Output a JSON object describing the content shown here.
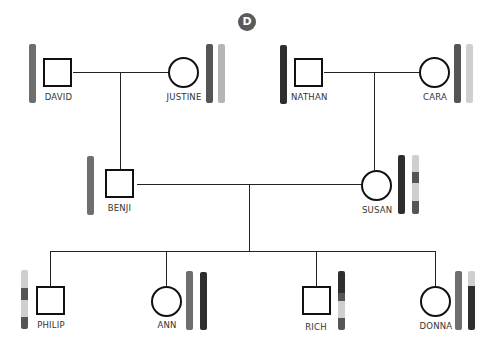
{
  "panel": {
    "label": "D",
    "badge_color": "#5a5a5a"
  },
  "colors": {
    "very_dark": "#2e2e2e",
    "dark": "#555555",
    "medium": "#6e6e6e",
    "light": "#bdbdbd",
    "lighter": "#cfcfcf",
    "line": "#222222"
  },
  "people": [
    {
      "id": "david",
      "name": "DAVID",
      "sex": "male",
      "generation": 1,
      "chromosomes": [
        [
          {
            "color": "#6e6e6e",
            "frac": 1
          }
        ]
      ]
    },
    {
      "id": "justine",
      "name": "JUSTINE",
      "sex": "female",
      "generation": 1,
      "chromosomes": [
        [
          {
            "color": "#555555",
            "frac": 1
          }
        ],
        [
          {
            "color": "#b5b5b5",
            "frac": 1
          }
        ]
      ]
    },
    {
      "id": "nathan",
      "name": "NATHAN",
      "sex": "male",
      "generation": 1,
      "chromosomes": [
        [
          {
            "color": "#2e2e2e",
            "frac": 1
          }
        ]
      ]
    },
    {
      "id": "cara",
      "name": "CARA",
      "sex": "female",
      "generation": 1,
      "chromosomes": [
        [
          {
            "color": "#555555",
            "frac": 1
          }
        ],
        [
          {
            "color": "#cfcfcf",
            "frac": 1
          }
        ]
      ]
    },
    {
      "id": "benji",
      "name": "BENJI",
      "sex": "male",
      "generation": 2,
      "chromosomes": [
        [
          {
            "color": "#6e6e6e",
            "frac": 1
          }
        ]
      ]
    },
    {
      "id": "susan",
      "name": "SUSAN",
      "sex": "female",
      "generation": 2,
      "chromosomes": [
        [
          {
            "color": "#2e2e2e",
            "frac": 1
          }
        ],
        [
          {
            "color": "#cfcfcf",
            "frac": 0.28
          },
          {
            "color": "#555555",
            "frac": 0.2
          },
          {
            "color": "#cfcfcf",
            "frac": 0.3
          },
          {
            "color": "#555555",
            "frac": 0.22
          }
        ]
      ]
    },
    {
      "id": "philip",
      "name": "PHILIP",
      "sex": "male",
      "generation": 3,
      "chromosomes": [
        [
          {
            "color": "#cfcfcf",
            "frac": 0.3
          },
          {
            "color": "#555555",
            "frac": 0.2
          },
          {
            "color": "#cfcfcf",
            "frac": 0.3
          },
          {
            "color": "#555555",
            "frac": 0.2
          }
        ]
      ]
    },
    {
      "id": "ann",
      "name": "ANN",
      "sex": "female",
      "generation": 3,
      "chromosomes": [
        [
          {
            "color": "#6e6e6e",
            "frac": 1
          }
        ],
        [
          {
            "color": "#2e2e2e",
            "frac": 1
          }
        ]
      ]
    },
    {
      "id": "rich",
      "name": "RICH",
      "sex": "male",
      "generation": 3,
      "chromosomes": [
        [
          {
            "color": "#2e2e2e",
            "frac": 0.38
          },
          {
            "color": "#555555",
            "frac": 0.12
          },
          {
            "color": "#cfcfcf",
            "frac": 0.3
          },
          {
            "color": "#555555",
            "frac": 0.2
          }
        ]
      ]
    },
    {
      "id": "donna",
      "name": "DONNA",
      "sex": "female",
      "generation": 3,
      "chromosomes": [
        [
          {
            "color": "#6e6e6e",
            "frac": 1
          }
        ],
        [
          {
            "color": "#cfcfcf",
            "frac": 0.26
          },
          {
            "color": "#2e2e2e",
            "frac": 0.74
          }
        ]
      ]
    }
  ],
  "relationships": [
    {
      "type": "mating",
      "partners": [
        "DAVID",
        "JUSTINE"
      ],
      "children": [
        "BENJI"
      ]
    },
    {
      "type": "mating",
      "partners": [
        "NATHAN",
        "CARA"
      ],
      "children": [
        "SUSAN"
      ]
    },
    {
      "type": "mating",
      "partners": [
        "BENJI",
        "SUSAN"
      ],
      "children": [
        "PHILIP",
        "ANN",
        "RICH",
        "DONNA"
      ]
    }
  ]
}
